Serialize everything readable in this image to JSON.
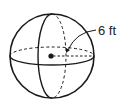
{
  "figure": {
    "type": "sphere",
    "radius_label": "6 ft",
    "colors": {
      "stroke": "#1a1a1a",
      "background": "#ffffff"
    }
  }
}
